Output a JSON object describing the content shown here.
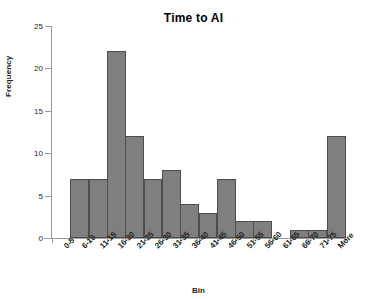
{
  "chart_data": {
    "type": "bar",
    "title": "Time to AI",
    "xlabel": "Bin",
    "ylabel": "Frequency",
    "categories": [
      "0-5",
      "6-10",
      "11-15",
      "16-20",
      "21-25",
      "26-30",
      "31-35",
      "36-40",
      "41-45",
      "46-50",
      "51-55",
      "56-60",
      "61-65",
      "66-70",
      "71-75",
      "More"
    ],
    "values": [
      0,
      7,
      7,
      22,
      12,
      7,
      8,
      4,
      3,
      7,
      2,
      2,
      0,
      1,
      1,
      12
    ],
    "ylim": [
      0,
      25
    ],
    "yticks": [
      0,
      5,
      10,
      15,
      20,
      25
    ],
    "ytick_labels": [
      "0",
      "5",
      "10",
      "15",
      "20",
      "25"
    ],
    "grid": false,
    "legend": false,
    "bar_fill_color": "#7f7f7f",
    "bar_border_color": "#4d4d4d",
    "axis_color": "#9a9a9a",
    "text_color": "#231f20",
    "background_color": "#ffffff"
  }
}
